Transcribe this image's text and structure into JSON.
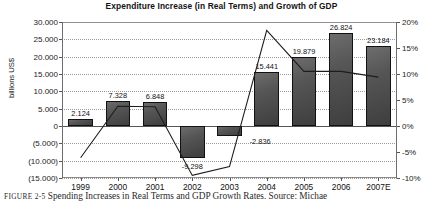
{
  "chart_data": {
    "type": "bar",
    "title": "Expenditure Increase (in Real Terms) and Growth of GDP",
    "xlabel": "",
    "ylabel": "billions US$",
    "y2label": "",
    "categories": [
      "1999",
      "2000",
      "2001",
      "2002",
      "2003",
      "2004",
      "2005",
      "2006",
      "2007E"
    ],
    "ylim": [
      -15000,
      30000
    ],
    "y2lim": [
      -10,
      20
    ],
    "yticks": [
      30000,
      25000,
      20000,
      15000,
      10000,
      5000,
      0,
      -5000,
      -10000,
      -15000
    ],
    "ytick_labels": [
      "30.000",
      "25.000",
      "20.000",
      "15.000",
      "10.000",
      "5.000",
      "0",
      "(5.000)",
      "(10.000)",
      "(15.000)"
    ],
    "y2ticks": [
      20,
      15,
      10,
      5,
      0,
      -5,
      -10
    ],
    "y2tick_labels": [
      "20%",
      "15%",
      "10%",
      "5%",
      "0%",
      "-5%",
      "-10%"
    ],
    "grid": true,
    "legend": "none",
    "series": [
      {
        "name": "Expenditure Increase (in Real Terms)",
        "type": "bar",
        "axis": "left",
        "values": [
          2124,
          7328,
          6848,
          -9298,
          -2836,
          15441,
          19879,
          26824,
          23184
        ],
        "data_labels": [
          "2.124",
          "7.328",
          "6.848",
          "-9.298",
          "-2.836",
          "15.441",
          "19.879",
          "26.824",
          "23.184"
        ]
      },
      {
        "name": "Growth of GDP",
        "type": "line",
        "axis": "right",
        "values": [
          -6.1,
          3.8,
          3.7,
          -9.5,
          -7.8,
          18.4,
          10.5,
          10.5,
          9.4
        ]
      }
    ]
  },
  "caption": {
    "figure_number": "FIGURE 2-5",
    "text": "Spending Increases in Real Terms and GDP Growth Rates. Source: Michae"
  }
}
